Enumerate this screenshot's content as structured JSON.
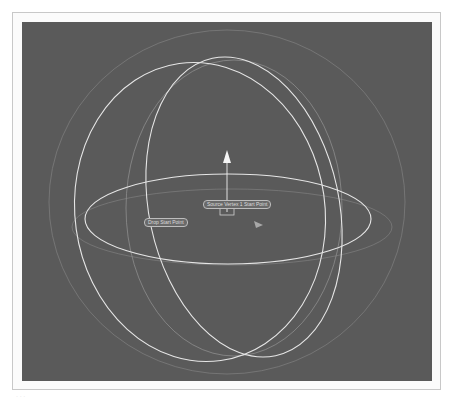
{
  "viewport": {
    "background": "#5a5a5a",
    "labels": {
      "source_point": "Source Vertex 1 Start Point",
      "drop_point": "Drop Start Point"
    }
  },
  "gizmo": {
    "axis": "up-arrow",
    "color": "#f0f0f0"
  },
  "caption": "· · ·"
}
